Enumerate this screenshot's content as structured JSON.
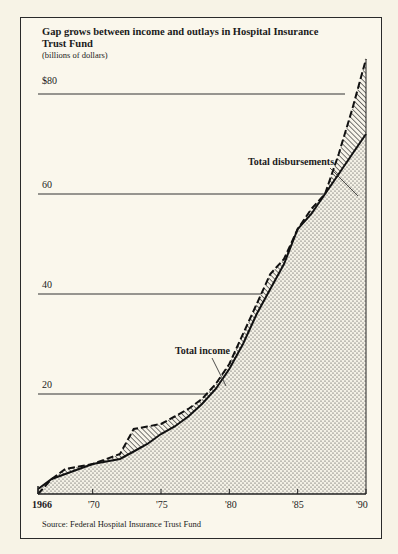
{
  "title": "Gap grows between income and outlays in Hospital Insurance Trust Fund",
  "subtitle": "(billions of dollars)",
  "source": "Source:  Federal Hospital Insurance Trust Fund",
  "y_labels": [
    "$80",
    "60",
    "40",
    "20"
  ],
  "x_labels": [
    "1966",
    "'70",
    "'75",
    "'80",
    "'85",
    "'90"
  ],
  "annotations": {
    "disbursements": "Total disbursements",
    "income": "Total income"
  },
  "chart_data": {
    "type": "area",
    "title": "Gap grows between income and outlays in Hospital Insurance Trust Fund",
    "subtitle": "(billions of dollars)",
    "xlabel": "",
    "ylabel": "billions of dollars",
    "ylim": [
      0,
      90
    ],
    "xlim": [
      1966,
      1990
    ],
    "yticks": [
      20,
      40,
      60,
      80
    ],
    "xticks": [
      1966,
      1970,
      1975,
      1980,
      1985,
      1990
    ],
    "grid": "horizontal",
    "legend": "inline annotations",
    "x": [
      1966,
      1967,
      1968,
      1969,
      1970,
      1971,
      1972,
      1973,
      1974,
      1975,
      1976,
      1977,
      1978,
      1979,
      1980,
      1981,
      1982,
      1983,
      1984,
      1985,
      1986,
      1987,
      1988,
      1989,
      1990
    ],
    "series": [
      {
        "name": "Total income",
        "style": "solid line, stippled fill",
        "values": [
          1,
          3,
          4,
          5,
          6,
          6.5,
          7,
          8.5,
          10,
          12,
          13.5,
          15.5,
          18,
          21,
          25,
          30,
          36,
          41,
          46,
          53,
          56,
          60,
          64,
          68,
          72
        ]
      },
      {
        "name": "Total disbursements",
        "style": "dashed line, hatched gap",
        "values": [
          0,
          3,
          5,
          5.5,
          6,
          7,
          8,
          13,
          13.5,
          14,
          15.5,
          17,
          19,
          22,
          26,
          32,
          38,
          44,
          47,
          53,
          57,
          60,
          68,
          77,
          87
        ]
      }
    ],
    "source": "Federal Hospital Insurance Trust Fund"
  }
}
